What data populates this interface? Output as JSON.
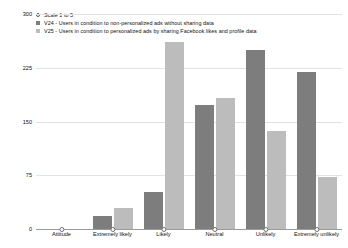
{
  "chart_data": {
    "type": "bar",
    "title": "",
    "xlabel": "",
    "ylabel": "",
    "ylim": [
      0,
      300
    ],
    "yticks": [
      0,
      75,
      150,
      225,
      300
    ],
    "grid": true,
    "legend_position": "top-left",
    "categories": [
      "Attitude",
      "Extremely likely",
      "Likely",
      "Neutral",
      "Unlikely",
      "Extremely unlikely"
    ],
    "series": [
      {
        "name": "V24 - Users in condition to non-personalized ads without sharing data",
        "color": "#7d7d7d",
        "values": [
          0,
          18,
          52,
          173,
          250,
          219
        ]
      },
      {
        "name": "V25 - Users in condition to personalized ads by sharing Facebook likes and profile data",
        "color": "#bcbcbc",
        "values": [
          0,
          29,
          261,
          183,
          137,
          73
        ]
      }
    ],
    "marker_series": {
      "name": "Scale 1 to 5",
      "marker": "open-circle",
      "values": [
        0,
        0,
        0,
        0,
        0,
        0
      ]
    }
  },
  "legend": {
    "items": [
      {
        "label": "Scale 1 to 5",
        "glyph": "open-circle-marker",
        "color": "#ffffff"
      },
      {
        "label": "V24 - Users in condition to non-personalized ads without sharing data",
        "glyph": "square-swatch",
        "color": "#7d7d7d"
      },
      {
        "label": "V25 - Users in condition to personalized ads by sharing Facebook likes and profile data",
        "glyph": "square-swatch",
        "color": "#bcbcbc"
      }
    ]
  },
  "axes": {
    "y_tick_labels": [
      "300",
      "225",
      "150",
      "75",
      "0"
    ],
    "x_tick_labels": [
      "Attitude",
      "Extremely likely",
      "Likely",
      "Neutral",
      "Unlikely",
      "Extremely unlikely"
    ]
  }
}
